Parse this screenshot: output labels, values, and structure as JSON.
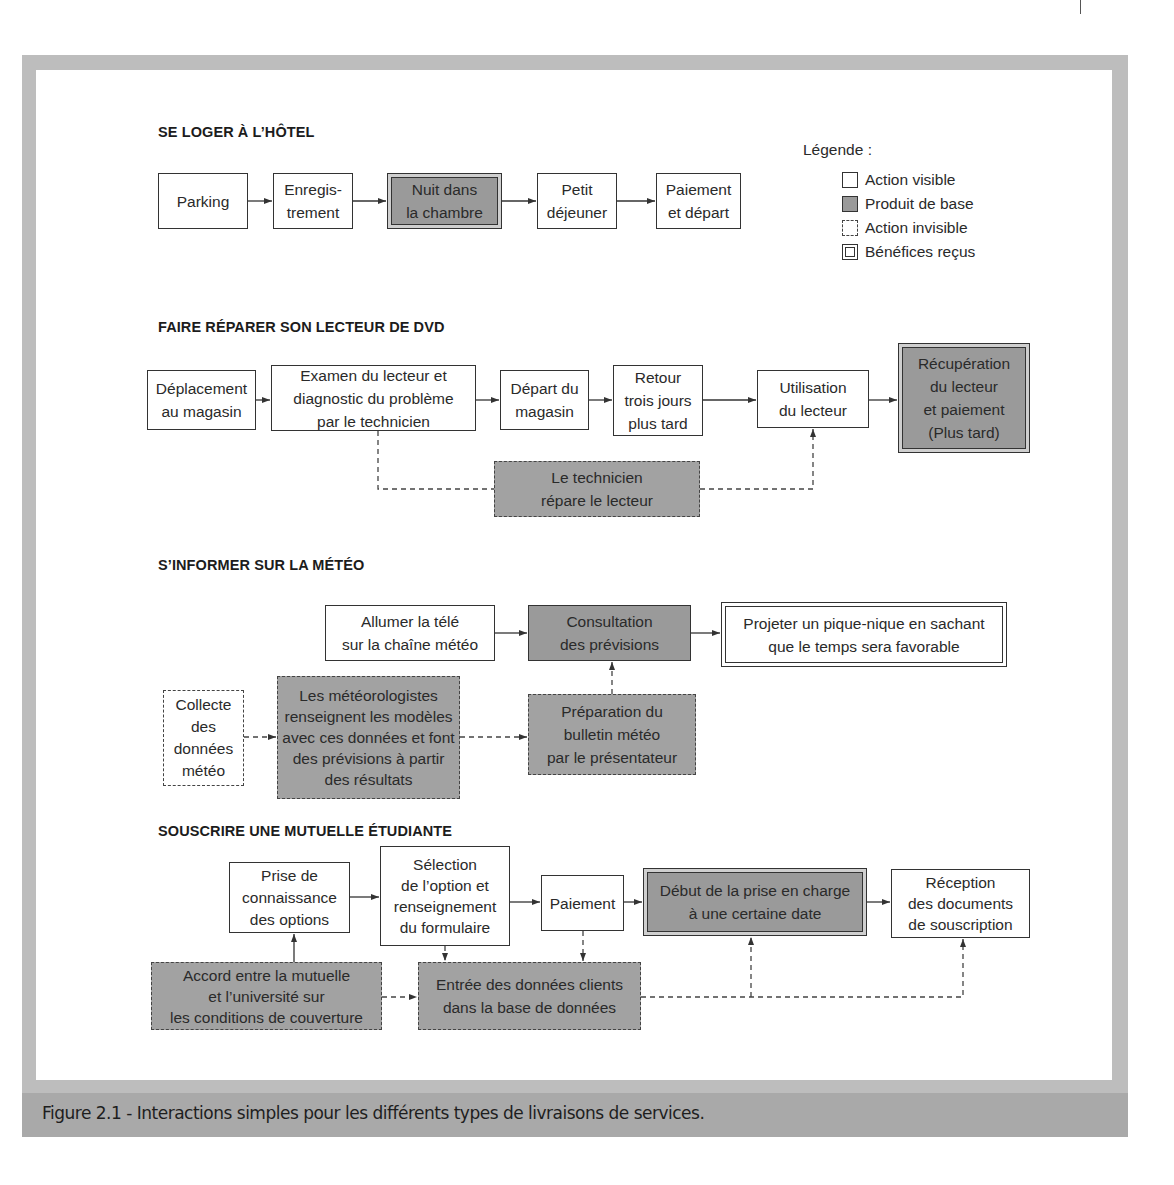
{
  "caption": "Figure 2.1 - Interactions simples pour les différents types de livraisons de services.",
  "legend": {
    "title": "Légende :",
    "items": [
      {
        "type": "visible",
        "label": "Action visible"
      },
      {
        "type": "core",
        "label": "Produit de base"
      },
      {
        "type": "invisible",
        "label": "Action invisible"
      },
      {
        "type": "benefit",
        "label": "Bénéfices reçus"
      }
    ]
  },
  "sections": [
    {
      "title": "SE LOGER À L’HÔTEL",
      "boxes": [
        {
          "id": "parking",
          "type": "visible",
          "text": "Parking"
        },
        {
          "id": "enregistrement",
          "type": "visible",
          "text": "Enregis-\ntrement"
        },
        {
          "id": "nuit",
          "type": "core-benefit",
          "text": "Nuit dans\nla chambre"
        },
        {
          "id": "petit-dejeuner",
          "type": "visible",
          "text": "Petit\ndéjeuner"
        },
        {
          "id": "paiement-depart",
          "type": "visible",
          "text": "Paiement\net départ"
        }
      ]
    },
    {
      "title": "FAIRE RÉPARER SON LECTEUR DE DVD",
      "boxes": [
        {
          "id": "deplacement",
          "type": "visible",
          "text": "Déplacement\nau magasin"
        },
        {
          "id": "examen",
          "type": "visible",
          "text": "Examen du lecteur et\ndiagnostic du problème\npar le technicien"
        },
        {
          "id": "depart-magasin",
          "type": "visible",
          "text": "Départ du\nmagasin"
        },
        {
          "id": "retour",
          "type": "visible",
          "text": "Retour\ntrois jours\nplus tard"
        },
        {
          "id": "utilisation",
          "type": "visible",
          "text": "Utilisation\ndu lecteur"
        },
        {
          "id": "recuperation",
          "type": "core-benefit",
          "text": "Récupération\ndu lecteur\net paiement\n(Plus tard)"
        },
        {
          "id": "technicien",
          "type": "invisible-core",
          "text": "Le technicien\nrépare le lecteur"
        }
      ]
    },
    {
      "title": "S’INFORMER SUR LA MÉTÉO",
      "boxes": [
        {
          "id": "allumer",
          "type": "visible",
          "text": "Allumer la télé\nsur la chaîne météo"
        },
        {
          "id": "consultation",
          "type": "core",
          "text": "Consultation\ndes prévisions"
        },
        {
          "id": "projeter",
          "type": "benefit",
          "text": "Projeter un pique-nique en sachant\nque le temps sera favorable"
        },
        {
          "id": "collecte",
          "type": "invisible",
          "text": "Collecte\ndes\ndonnées\nmétéo"
        },
        {
          "id": "meteorologistes",
          "type": "invisible-core",
          "text": "Les météorologistes\nrenseignent les modèles\navec ces données et font\ndes prévisions à partir\ndes résultats"
        },
        {
          "id": "preparation",
          "type": "invisible-core",
          "text": "Préparation du\nbulletin météo\npar le présentateur"
        }
      ]
    },
    {
      "title": "SOUSCRIRE UNE MUTUELLE ÉTUDIANTE",
      "boxes": [
        {
          "id": "prise-connaissance",
          "type": "visible",
          "text": "Prise de\nconnaissance\ndes options"
        },
        {
          "id": "selection",
          "type": "visible",
          "text": "Sélection\nde l’option et\nrenseignement\ndu formulaire"
        },
        {
          "id": "paiement",
          "type": "visible",
          "text": "Paiement"
        },
        {
          "id": "debut",
          "type": "core-benefit",
          "text": "Début de la prise en charge\nà une certaine date"
        },
        {
          "id": "reception",
          "type": "visible",
          "text": "Réception\ndes documents\nde souscription"
        },
        {
          "id": "accord",
          "type": "invisible-core",
          "text": "Accord entre la mutuelle\net l’université sur\nles conditions de couverture"
        },
        {
          "id": "entree",
          "type": "invisible-core",
          "text": "Entrée des données clients\ndans la base de données"
        }
      ]
    }
  ]
}
